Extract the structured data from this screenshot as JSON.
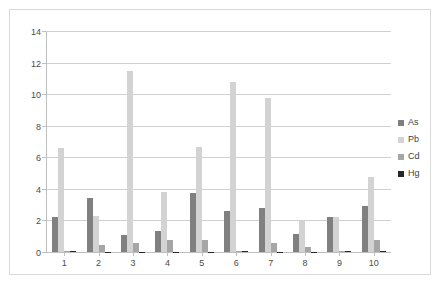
{
  "chart_data": {
    "type": "bar",
    "title": "",
    "xlabel": "",
    "ylabel": "",
    "ylim": [
      0,
      14
    ],
    "yticks": [
      0,
      2,
      4,
      6,
      8,
      10,
      12,
      14
    ],
    "grid": "horizontal",
    "legend_position": "right",
    "categories": [
      "1",
      "2",
      "3",
      "4",
      "5",
      "6",
      "7",
      "8",
      "9",
      "10"
    ],
    "series": [
      {
        "name": "As",
        "color": "#808080",
        "values": [
          2.2,
          3.45,
          1.1,
          1.35,
          3.75,
          2.6,
          2.8,
          1.15,
          2.2,
          2.9
        ]
      },
      {
        "name": "Pb",
        "color": "#d3d3d3",
        "values": [
          6.6,
          2.3,
          11.55,
          3.85,
          6.7,
          10.85,
          9.8,
          1.95,
          2.25,
          4.75
        ]
      },
      {
        "name": "Cd",
        "color": "#a6a6a6",
        "values": [
          0.05,
          0.47,
          0.55,
          0.75,
          0.78,
          0.05,
          0.6,
          0.3,
          0.05,
          0.75
        ]
      },
      {
        "name": "Hg",
        "color": "#262626",
        "values": [
          0.07,
          0.02,
          0.02,
          0.02,
          0.02,
          0.06,
          0.02,
          0.02,
          0.06,
          0.05
        ]
      }
    ]
  },
  "legend": {
    "items": [
      {
        "label": "As"
      },
      {
        "label": "Pb"
      },
      {
        "label": "Cd"
      },
      {
        "label": "Hg"
      }
    ]
  }
}
